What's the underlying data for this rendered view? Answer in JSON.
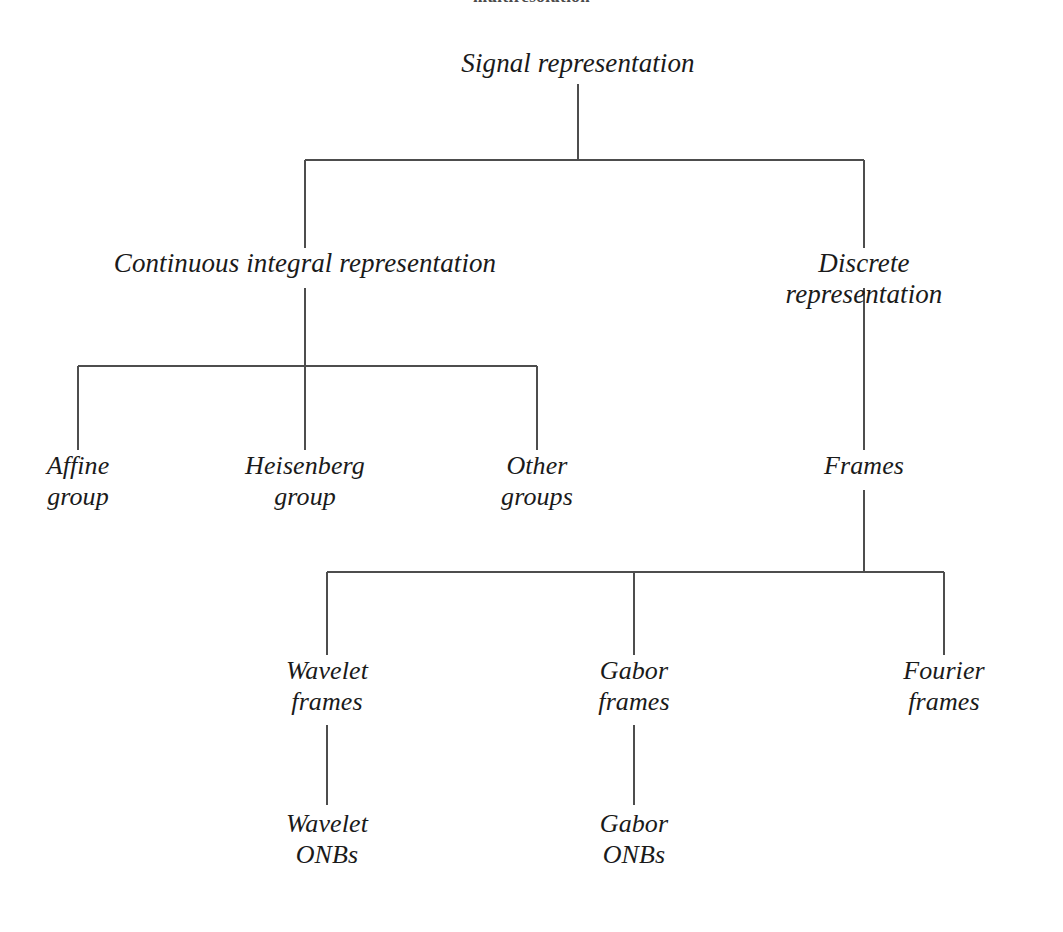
{
  "diagram": {
    "caption_fragment": "multiresolution",
    "background_color": "#ffffff",
    "line_color": "#4d4d4d",
    "text_color": "#1a1a1a",
    "nodes": [
      {
        "id": "signal-representation",
        "label": "Signal representation",
        "line1": "Signal representation",
        "line2": "",
        "x": 578,
        "y": 48,
        "level": 0
      },
      {
        "id": "continuous-integral",
        "label": "Continuous integral representation",
        "line1": "Continuous integral representation",
        "line2": "",
        "x": 305,
        "y": 248,
        "level": 1
      },
      {
        "id": "discrete-representation",
        "label": "Discrete representation",
        "line1": "Discrete representation",
        "line2": "",
        "x": 864,
        "y": 248,
        "level": 1
      },
      {
        "id": "affine-group",
        "label": "Affine group",
        "line1": "Affine",
        "line2": "group",
        "x": 78,
        "y": 450,
        "level": 2
      },
      {
        "id": "heisenberg-group",
        "label": "Heisenberg group",
        "line1": "Heisenberg",
        "line2": "group",
        "x": 305,
        "y": 450,
        "level": 2
      },
      {
        "id": "other-groups",
        "label": "Other groups",
        "line1": "Other",
        "line2": "groups",
        "x": 537,
        "y": 450,
        "level": 2
      },
      {
        "id": "frames",
        "label": "Frames",
        "line1": "Frames",
        "line2": "",
        "x": 864,
        "y": 450,
        "level": 2
      },
      {
        "id": "wavelet-frames",
        "label": "Wavelet frames",
        "line1": "Wavelet",
        "line2": "frames",
        "x": 327,
        "y": 655,
        "level": 3
      },
      {
        "id": "gabor-frames",
        "label": "Gabor frames",
        "line1": "Gabor",
        "line2": "frames",
        "x": 634,
        "y": 655,
        "level": 3
      },
      {
        "id": "fourier-frames",
        "label": "Fourier frames",
        "line1": "Fourier",
        "line2": "frames",
        "x": 944,
        "y": 655,
        "level": 3
      },
      {
        "id": "wavelet-onbs",
        "label": "Wavelet ONBs",
        "line1": "Wavelet",
        "line2": "ONBs",
        "x": 327,
        "y": 808,
        "level": 4
      },
      {
        "id": "gabor-onbs",
        "label": "Gabor ONBs",
        "line1": "Gabor",
        "line2": "ONBs",
        "x": 634,
        "y": 808,
        "level": 4
      }
    ],
    "edges": [
      {
        "from": "signal-representation",
        "to": "continuous-integral"
      },
      {
        "from": "signal-representation",
        "to": "discrete-representation"
      },
      {
        "from": "continuous-integral",
        "to": "affine-group"
      },
      {
        "from": "continuous-integral",
        "to": "heisenberg-group"
      },
      {
        "from": "continuous-integral",
        "to": "other-groups"
      },
      {
        "from": "discrete-representation",
        "to": "frames"
      },
      {
        "from": "frames",
        "to": "wavelet-frames"
      },
      {
        "from": "frames",
        "to": "gabor-frames"
      },
      {
        "from": "frames",
        "to": "fourier-frames"
      },
      {
        "from": "wavelet-frames",
        "to": "wavelet-onbs"
      },
      {
        "from": "gabor-frames",
        "to": "gabor-onbs"
      }
    ]
  }
}
